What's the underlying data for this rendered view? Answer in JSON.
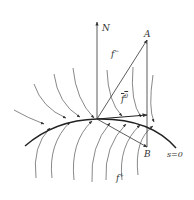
{
  "diagram": {
    "type": "sliding-mode-vector-field",
    "labels": {
      "normal": "N",
      "point_a": "A",
      "point_b": "B",
      "f_minus": "f",
      "f_minus_sup": "−",
      "f_zero": "f",
      "f_zero_sup": "0",
      "f_plus": "f",
      "f_plus_sup": "+",
      "surface": "s=0"
    },
    "colors": {
      "stroke": "#333333",
      "curve": "#222222",
      "background": "#ffffff"
    }
  }
}
